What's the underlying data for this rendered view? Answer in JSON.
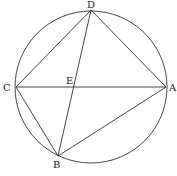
{
  "diagram": {
    "type": "cyclic-quadrilateral",
    "colors": {
      "stroke": "#333333",
      "label": "#222222",
      "background": "#ffffff"
    },
    "circle": {
      "cx": 91,
      "cy": 87,
      "r": 76
    },
    "points": {
      "A": {
        "label": "A",
        "x": 166,
        "y": 87,
        "lx": 169,
        "ly": 91
      },
      "B": {
        "label": "B",
        "x": 58,
        "y": 156,
        "lx": 53,
        "ly": 168
      },
      "C": {
        "label": "C",
        "x": 16,
        "y": 87,
        "lx": 3,
        "ly": 91
      },
      "D": {
        "label": "D",
        "x": 91,
        "y": 10,
        "lx": 87,
        "ly": 8
      },
      "E": {
        "label": "E",
        "x": 74,
        "y": 87,
        "lx": 66,
        "ly": 84
      }
    },
    "segments": [
      [
        "C",
        "D"
      ],
      [
        "D",
        "A"
      ],
      [
        "A",
        "B"
      ],
      [
        "B",
        "C"
      ],
      [
        "C",
        "A"
      ],
      [
        "D",
        "B"
      ]
    ]
  }
}
